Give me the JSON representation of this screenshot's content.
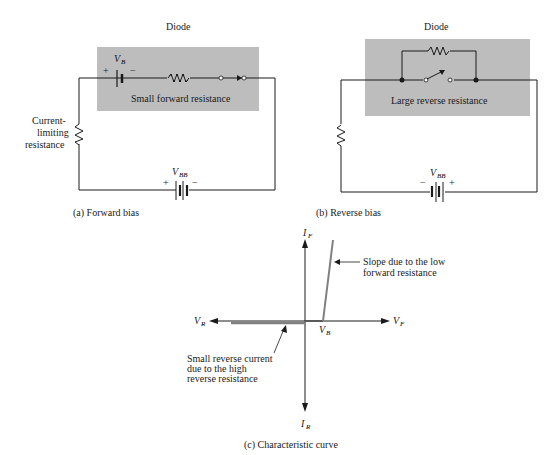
{
  "panel_a": {
    "title": "Diode",
    "box_label": "Small forward resistance",
    "barrier_voltage_label": "V",
    "barrier_voltage_sub": "B",
    "barrier_plus": "+",
    "barrier_minus": "−",
    "limiting_label_line1": "Current-",
    "limiting_label_line2": "limiting",
    "limiting_label_line3": "resistance",
    "supply_label": "V",
    "supply_sub": "BB",
    "supply_plus": "+",
    "supply_minus": "−",
    "caption": "(a) Forward bias"
  },
  "panel_b": {
    "title": "Diode",
    "box_label": "Large reverse resistance",
    "supply_label": "V",
    "supply_sub": "BB",
    "supply_minus": "−",
    "supply_plus": "+",
    "caption": "(b) Reverse bias"
  },
  "panel_c": {
    "axis_if": "I",
    "axis_if_sub": "F",
    "axis_ir": "I",
    "axis_ir_sub": "R",
    "axis_vf": "V",
    "axis_vf_sub": "F",
    "axis_vr": "V",
    "axis_vr_sub": "R",
    "vb": "V",
    "vb_sub": "B",
    "slope_note_line1": "Slope due to the low",
    "slope_note_line2": "forward resistance",
    "reverse_note_line1": "Small reverse current",
    "reverse_note_line2": "due to the high",
    "reverse_note_line3": "reverse resistance",
    "caption": "(c) Characteristic curve"
  }
}
